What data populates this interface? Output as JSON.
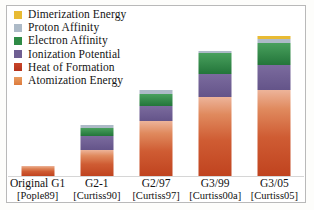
{
  "chart_data": {
    "type": "bar",
    "subtype": "stacked-bar",
    "title": "",
    "xlabel": "",
    "ylabel": "",
    "grid": false,
    "legend_position": "top-left",
    "categories": [
      "Original G1",
      "G2-1",
      "G2/97",
      "G3/99",
      "G3/05"
    ],
    "category_sublabels": [
      "[Pople89]",
      "[Curtiss90]",
      "[Curtiss97]",
      "[Curtiss00a]",
      "[Curtiss05]"
    ],
    "ylim": [
      0,
      170
    ],
    "series": [
      {
        "name": "Atomization Energy",
        "color": "#e08040",
        "values": [
          10,
          26,
          55,
          79,
          86
        ]
      },
      {
        "name": "Heat of Formation",
        "color": "#bf3b22",
        "values": [
          0,
          0,
          0,
          0,
          0
        ]
      },
      {
        "name": "Ionization Potential",
        "color": "#6f5f93",
        "values": [
          0,
          14,
          15,
          23,
          25
        ]
      },
      {
        "name": "Electron Affinity",
        "color": "#2f8b46",
        "values": [
          0,
          8,
          12,
          21,
          22
        ]
      },
      {
        "name": "Proton Affinity",
        "color": "#adbac7",
        "values": [
          0,
          3,
          4,
          2,
          4
        ]
      },
      {
        "name": "Dimerization Energy",
        "color": "#e8bb34",
        "values": [
          0,
          0,
          0,
          0,
          3
        ]
      }
    ],
    "totals": [
      10,
      51,
      86,
      125,
      140
    ]
  },
  "legend": {
    "items": [
      {
        "label": "Dimerization Energy",
        "color": "#e8bb34"
      },
      {
        "label": "Proton Affinity",
        "color": "#adbac7"
      },
      {
        "label": "Electron Affinity",
        "color": "#2f8b46"
      },
      {
        "label": "Ionization Potential",
        "color": "#6f5f93"
      },
      {
        "label": "Heat of Formation",
        "color": "#bf3b22"
      },
      {
        "label": "Atomization Energy",
        "color": "#e08040"
      }
    ]
  }
}
